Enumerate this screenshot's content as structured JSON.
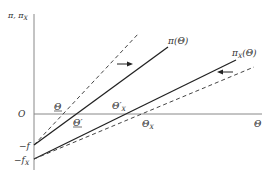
{
  "axes": {
    "y_label": "π, π",
    "y_label_sub": "X",
    "x_label": "Θ",
    "origin_label": "O"
  },
  "intercepts": {
    "f": "−f",
    "fx": "−f",
    "fx_sub": "X"
  },
  "curves": {
    "pi": "π(Θ)",
    "pix_main": "π",
    "pix_sub": "X",
    "pix_arg": "(Θ)"
  },
  "points": {
    "theta_under": "Θ",
    "theta_prime_under": "Θ′",
    "theta_x_prime": "Θ′",
    "theta_x_prime_sub": "X",
    "theta_x": "Θ",
    "theta_x_sub": "X"
  },
  "colors": {
    "line": "#222222",
    "axis": "#888888",
    "dash": "#444444"
  }
}
